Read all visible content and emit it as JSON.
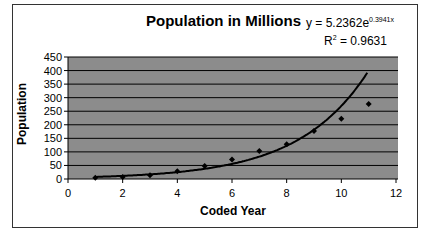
{
  "chart_data": {
    "type": "scatter",
    "title": "Population in Millions",
    "xlabel": "Coded Year",
    "ylabel": "Population",
    "xlim": [
      0,
      12
    ],
    "ylim": [
      0,
      450
    ],
    "xticks": [
      0,
      2,
      4,
      6,
      8,
      10,
      12
    ],
    "yticks": [
      0,
      50,
      100,
      150,
      200,
      250,
      300,
      350,
      400,
      450
    ],
    "grid": true,
    "legend": "none",
    "series": [
      {
        "name": "Population",
        "x": [
          1,
          2,
          3,
          4,
          5,
          6,
          7,
          8,
          9,
          10,
          11
        ],
        "values": [
          5,
          7,
          14,
          29,
          48,
          72,
          103,
          128,
          177,
          222,
          277
        ]
      }
    ],
    "trendline": {
      "type": "exponential",
      "equation": "y = 5.2362e^0.3941x",
      "a": 5.2362,
      "b": 0.3941,
      "r_squared": "R² = 0.9631"
    },
    "colors": {
      "plot_bg": "#8c8c8c",
      "gridline": "#000000",
      "marker": "#000000"
    }
  },
  "labels": {
    "title": "Population in Millions",
    "eq_prefix": "y = 5.2362e",
    "eq_exp": "0.3941x",
    "r2_prefix": "R",
    "r2_sup": "2",
    "r2_value": " = 0.9631",
    "ylabel": "Population",
    "xlabel": "Coded Year"
  }
}
